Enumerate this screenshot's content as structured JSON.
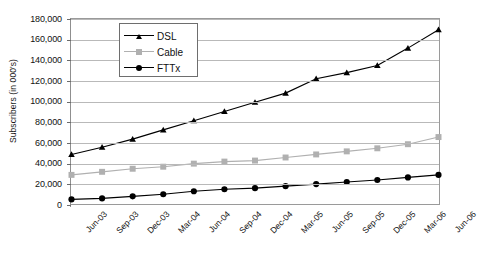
{
  "chart_data": {
    "type": "line",
    "title": "",
    "xlabel": "",
    "ylabel": "Subscribers (in 000's)",
    "categories": [
      "Jun-03",
      "Sep-03",
      "Dec-03",
      "Mar-04",
      "Jun-04",
      "Sep-04",
      "Dec-04",
      "Mar-05",
      "Jun-05",
      "Sep-05",
      "Dec-05",
      "Mar-06",
      "Jun-06"
    ],
    "ylim": [
      0,
      180000
    ],
    "ytick_step": 20000,
    "ytick_labels": [
      "0",
      "20,000",
      "40,000",
      "60,000",
      "80,000",
      "100,000",
      "120,000",
      "140,000",
      "160,000",
      "180,000"
    ],
    "ytick_values": [
      0,
      20000,
      40000,
      60000,
      80000,
      100000,
      120000,
      140000,
      160000,
      180000
    ],
    "grid": true,
    "legend_position": "upper-left-inside",
    "series": [
      {
        "name": "DSL",
        "color": "#000000",
        "marker": "triangle",
        "values": [
          48000,
          55000,
          63000,
          72000,
          81000,
          90000,
          99000,
          108000,
          122000,
          128000,
          135000,
          152000,
          170000
        ]
      },
      {
        "name": "Cable",
        "color": "#b0b0b0",
        "marker": "square",
        "values": [
          28000,
          31000,
          34000,
          36000,
          39000,
          41000,
          42000,
          45000,
          48000,
          51000,
          54000,
          58000,
          65000
        ]
      },
      {
        "name": "FTTx",
        "color": "#000000",
        "marker": "circle",
        "values": [
          4000,
          5000,
          7000,
          9000,
          12000,
          14000,
          15000,
          17000,
          19000,
          21000,
          23000,
          25500,
          28000
        ]
      }
    ]
  },
  "legend": {
    "items": [
      {
        "label": "DSL"
      },
      {
        "label": "Cable"
      },
      {
        "label": "FTTx"
      }
    ]
  },
  "colors": {
    "grid": "#b9b9b9",
    "frame": "#9a9a9a",
    "dsl": "#000000",
    "cable": "#b0b0b0",
    "fttx": "#000000",
    "background": "#ffffff"
  }
}
